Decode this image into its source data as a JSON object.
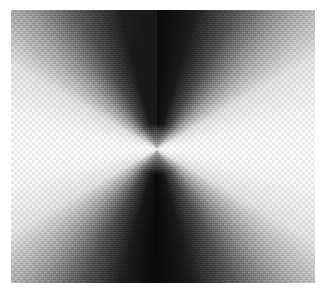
{
  "figure": {
    "title": "",
    "caption": "",
    "kind": "angular-intensity-field",
    "page_background": "#ffffff",
    "frame": {
      "left": 11,
      "top": 10,
      "width": 304,
      "height": 273
    },
    "singularity": {
      "x_pct": 48,
      "y_pct": 51
    }
  },
  "chart_data": {
    "type": "heatmap",
    "title": "",
    "subtitle": "",
    "xlabel": "",
    "ylabel": "",
    "colormap": "grayscale",
    "grid": false,
    "legend": "none",
    "center_fraction": {
      "x": 0.48,
      "y": 0.51
    },
    "angular_profile": {
      "angles_deg": [
        0,
        15,
        30,
        45,
        60,
        75,
        90,
        105,
        120,
        135,
        150,
        165,
        180,
        195,
        210,
        225,
        240,
        255,
        270,
        285,
        300,
        315,
        330,
        345,
        360
      ],
      "intensity_0_255": [
        255,
        250,
        232,
        160,
        78,
        26,
        8,
        26,
        78,
        160,
        232,
        250,
        255,
        250,
        232,
        160,
        78,
        26,
        10,
        26,
        78,
        160,
        232,
        250,
        255
      ]
    },
    "sampled_regions": [
      {
        "label": "top-center",
        "x_pct": 50,
        "y_pct": 6,
        "gray": 12,
        "hex": "#0c0c0c"
      },
      {
        "label": "bottom-center",
        "x_pct": 50,
        "y_pct": 95,
        "gray": 14,
        "hex": "#0e0e0e"
      },
      {
        "label": "left-middle",
        "x_pct": 5,
        "y_pct": 50,
        "gray": 252,
        "hex": "#fcfcfc"
      },
      {
        "label": "right-middle",
        "x_pct": 95,
        "y_pct": 50,
        "gray": 253,
        "hex": "#fdfdfd"
      },
      {
        "label": "top-left-corner",
        "x_pct": 6,
        "y_pct": 6,
        "gray": 74,
        "hex": "#4a4a4a"
      },
      {
        "label": "top-right-corner",
        "x_pct": 95,
        "y_pct": 6,
        "gray": 96,
        "hex": "#606060"
      },
      {
        "label": "bottom-left-corner",
        "x_pct": 6,
        "y_pct": 95,
        "gray": 82,
        "hex": "#525252"
      },
      {
        "label": "bottom-right-corner",
        "x_pct": 95,
        "y_pct": 95,
        "gray": 112,
        "hex": "#707070"
      },
      {
        "label": "center-core",
        "x_pct": 48,
        "y_pct": 51,
        "gray": 246,
        "hex": "#f6f6f6"
      }
    ],
    "value_range": [
      0,
      255
    ],
    "colors": {
      "min": "#000000",
      "mid": "#808080",
      "max": "#ffffff",
      "background": "#ffffff"
    }
  }
}
